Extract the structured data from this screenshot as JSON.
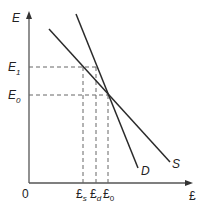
{
  "diagram": {
    "axes": {
      "y_label": "E",
      "x_label": "£",
      "origin": "0"
    },
    "y_ticks": [
      {
        "base": "E",
        "sub": "1"
      },
      {
        "base": "E",
        "sub": "0"
      }
    ],
    "x_ticks": [
      {
        "base": "£",
        "sub": "s"
      },
      {
        "base": "£",
        "sub": "d"
      },
      {
        "base": "£",
        "sub": "0"
      }
    ],
    "curves": [
      {
        "name": "D",
        "label": "D"
      },
      {
        "name": "S",
        "label": "S"
      }
    ],
    "colors": {
      "line": "#2a2a2a",
      "axis": "#555555",
      "dash": "#666666"
    }
  }
}
